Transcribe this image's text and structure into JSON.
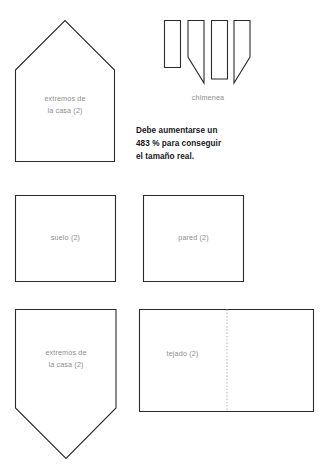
{
  "document": {
    "type": "craft-cutting-template",
    "background_color": "#ffffff",
    "outline_color": "#2b2b2b",
    "label_color": "#8d8d8d",
    "note_color": "#18181c",
    "fold_line_color": "#b6b6b6"
  },
  "pieces": {
    "house_end_top": {
      "label_line1": "extremos de",
      "label_line2": "la casa (2)",
      "shape": "pentagon-roof-up"
    },
    "chimney": {
      "label": "chimenea",
      "shape": "four-strips",
      "strip_count": 4
    },
    "floor": {
      "label": "suelo (2)",
      "shape": "square"
    },
    "wall": {
      "label": "pared (2)",
      "shape": "square"
    },
    "house_end_bottom": {
      "label_line1": "extremos de",
      "label_line2": "la casa (2)",
      "shape": "pentagon-point-down"
    },
    "roof": {
      "label": "tejado (2)",
      "shape": "rectangle-with-fold-line"
    }
  },
  "note": {
    "line1": "Debe aumentarse un",
    "line2": "483 % para conseguir",
    "line3": "el tamaño real.",
    "scale_percent": "483 %"
  }
}
